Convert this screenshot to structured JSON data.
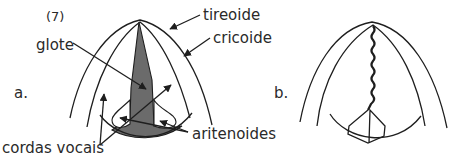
{
  "figure": {
    "number_label": "(7)",
    "panels": [
      {
        "id": "a",
        "panel_label": "a.",
        "labels": {
          "tireoide": "tireoide",
          "cricoide": "cricoide",
          "glote": "glote",
          "cordas_vocais": "cordas vocais",
          "aritenoides": "aritenoides"
        }
      },
      {
        "id": "b",
        "panel_label": "b."
      }
    ]
  },
  "colors": {
    "stroke": "#1e1e1e",
    "glottis_fill": "#6b6b6b",
    "text": "#2a2a2a",
    "background": "#ffffff"
  }
}
